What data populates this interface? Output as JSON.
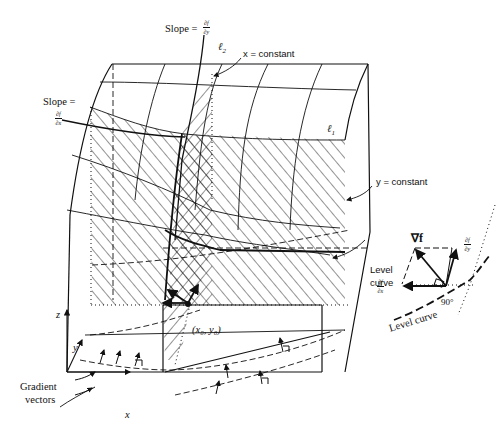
{
  "figure": {
    "type": "textbook-diagram"
  },
  "labels": {
    "slope_y": "Slope =",
    "slope_y_frac": {
      "num": "∂f",
      "den": "∂y"
    },
    "l2": "ℓ",
    "l2_sub": "2",
    "x_constant": "x = constant",
    "slope_x": "Slope =",
    "slope_x_frac": {
      "num": "∂f",
      "den": "∂x"
    },
    "l1": "ℓ",
    "l1_sub": "1",
    "y_constant": "y = constant",
    "level_curve_main_line1": "Level",
    "level_curve_main_line2": "curve",
    "point": "(x₀, y₀)",
    "axis_z": "z",
    "axis_y": "y",
    "axis_x": "x",
    "gradient_vectors_line1": "Gradient",
    "gradient_vectors_line2": "vectors"
  },
  "inset": {
    "grad_label": "∇f",
    "dfdy_frac": {
      "num": "∂f",
      "den": "∂y"
    },
    "dfdx_frac": {
      "num": "∂f",
      "den": "∂x"
    },
    "angle_label": "90°",
    "level_curve_label": "Level curve"
  },
  "colors": {
    "ink": "#111111",
    "background": "#ffffff"
  }
}
